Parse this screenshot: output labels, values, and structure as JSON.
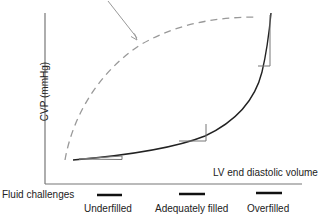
{
  "axes": {
    "y_label": "CVP (mmHg)",
    "x_label": "LV end diastolic volume"
  },
  "fluid_challenges": {
    "label": "Fluid challenges",
    "categories": [
      {
        "label": "Underfilled"
      },
      {
        "label": "Adequately filled"
      },
      {
        "label": "Overfilled"
      }
    ]
  },
  "curves": [
    {
      "name": "normal-compliance",
      "style": "solid",
      "color": "#222222"
    },
    {
      "name": "reduced-compliance",
      "style": "dashed",
      "color": "#999999"
    }
  ],
  "arrow_color": "#999999",
  "axis_color": "#666666"
}
